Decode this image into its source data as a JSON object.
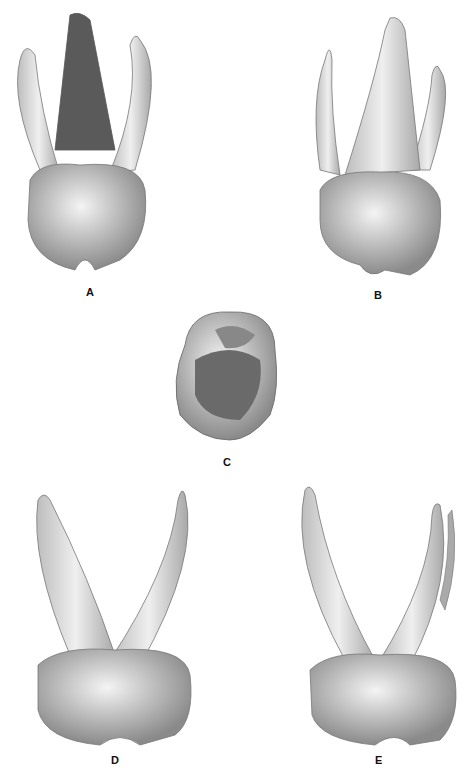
{
  "figure": {
    "panels": [
      {
        "label": "A",
        "view": "tooth-three-roots-lingual"
      },
      {
        "label": "B",
        "view": "tooth-three-roots-buccal"
      },
      {
        "label": "C",
        "view": "tooth-occlusal"
      },
      {
        "label": "D",
        "view": "tooth-roots-mesial"
      },
      {
        "label": "E",
        "view": "tooth-roots-distal"
      }
    ]
  }
}
